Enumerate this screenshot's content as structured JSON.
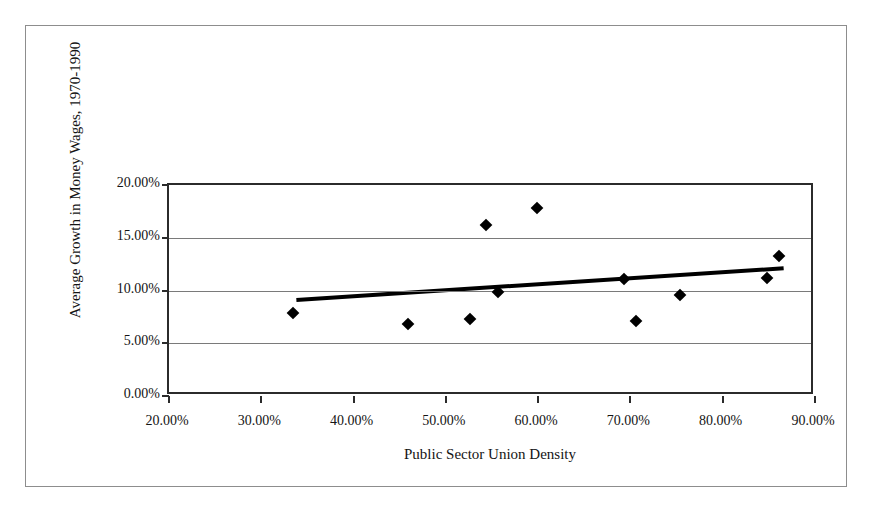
{
  "chart_data": {
    "type": "scatter",
    "title": "",
    "xlabel": "Public Sector Union Density",
    "ylabel": "Average Growth in Money Wages, 1970-1990",
    "xlim": [
      20,
      90
    ],
    "ylim": [
      0,
      20
    ],
    "xticks": [
      20,
      30,
      40,
      50,
      60,
      70,
      80,
      90
    ],
    "yticks": [
      0,
      5,
      10,
      15,
      20
    ],
    "xtick_labels": [
      "20.00%",
      "30.00%",
      "40.00%",
      "50.00%",
      "60.00%",
      "70.00%",
      "80.00%",
      "90.00%"
    ],
    "ytick_labels": [
      "0.00%",
      "5.00%",
      "10.00%",
      "15.00%",
      "20.00%"
    ],
    "grid": "horizontal",
    "legend": "none",
    "marker": "filled-diamond",
    "marker_color": "#000000",
    "points": [
      {
        "x": 33.4,
        "y": 7.9
      },
      {
        "x": 45.9,
        "y": 6.8
      },
      {
        "x": 52.6,
        "y": 7.3
      },
      {
        "x": 54.4,
        "y": 16.2
      },
      {
        "x": 55.7,
        "y": 9.9
      },
      {
        "x": 59.9,
        "y": 17.8
      },
      {
        "x": 69.3,
        "y": 11.1
      },
      {
        "x": 70.6,
        "y": 7.1
      },
      {
        "x": 75.4,
        "y": 9.6
      },
      {
        "x": 84.8,
        "y": 11.2
      },
      {
        "x": 86.1,
        "y": 13.3
      }
    ],
    "trendline": {
      "type": "linear",
      "x_start": 33.8,
      "y_start": 9.1,
      "x_end": 86.6,
      "y_end": 12.1,
      "color": "#000000",
      "width": 4
    }
  },
  "figure": {
    "background_color": "#ffffff",
    "frame_color": "#8d8d8d",
    "axis_color": "#2b2b2b",
    "gridline_color": "#7a7a7a"
  }
}
